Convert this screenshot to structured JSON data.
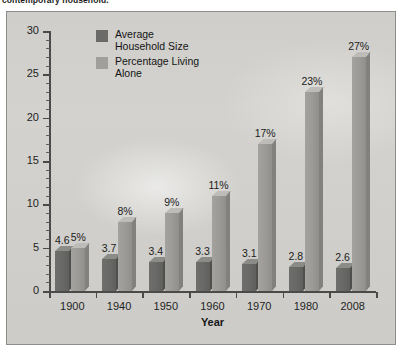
{
  "caption": {
    "text": "contemporary household."
  },
  "chart_data": {
    "type": "bar",
    "title": "",
    "subtitle": "",
    "xlabel": "Year",
    "ylabel": "",
    "ylim": [
      0,
      30
    ],
    "yticks": [
      0,
      5,
      10,
      15,
      20,
      25,
      30
    ],
    "ytick_labels": [
      "0",
      "5",
      "10",
      "15",
      "20",
      "25",
      "30"
    ],
    "minor_tick_step": 1,
    "grid": false,
    "legend_position": "upper-left-inside",
    "categories": [
      "1900",
      "1940",
      "1950",
      "1960",
      "1970",
      "1980",
      "2008"
    ],
    "series": [
      {
        "name": "Average Household Size",
        "color": "#686866",
        "values": [
          4.6,
          3.7,
          3.4,
          3.3,
          3.1,
          2.8,
          2.6
        ],
        "value_labels": [
          "4.6",
          "3.7",
          "3.4",
          "3.3",
          "3.1",
          "2.8",
          "2.6"
        ]
      },
      {
        "name": "Percentage Living Alone",
        "color": "#9b9a96",
        "values": [
          5,
          8,
          9,
          11,
          17,
          23,
          27
        ],
        "value_labels": [
          "5%",
          "8%",
          "9%",
          "11%",
          "17%",
          "23%",
          "27%"
        ]
      }
    ]
  },
  "legend": {
    "entries": [
      {
        "label": "Average\nHousehold Size",
        "swatch": "dark"
      },
      {
        "label": "Percentage Living\nAlone",
        "swatch": "light"
      }
    ]
  }
}
